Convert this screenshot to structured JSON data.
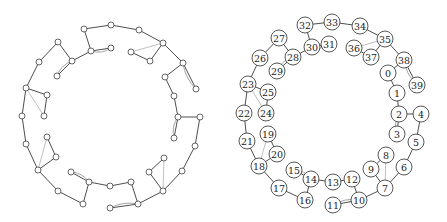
{
  "figure": {
    "panels": [
      {
        "id": "left",
        "description": "unlabeled graph drawing"
      },
      {
        "id": "right",
        "description": "labeled graph drawing"
      }
    ]
  },
  "nodes": [
    {
      "id": "0",
      "L": [
        165,
        77
      ],
      "R": [
        388,
        73
      ]
    },
    {
      "id": "1",
      "L": [
        174,
        96
      ],
      "R": [
        397,
        93
      ]
    },
    {
      "id": "2",
      "L": [
        178,
        117
      ],
      "R": [
        399,
        114
      ]
    },
    {
      "id": "3",
      "L": [
        174,
        138
      ],
      "R": [
        397,
        134
      ]
    },
    {
      "id": "4",
      "L": [
        200,
        117
      ],
      "R": [
        421,
        114
      ]
    },
    {
      "id": "5",
      "L": [
        195,
        146
      ],
      "R": [
        416,
        142
      ]
    },
    {
      "id": "6",
      "L": [
        182,
        171
      ],
      "R": [
        404,
        167
      ]
    },
    {
      "id": "7",
      "L": [
        163,
        191
      ],
      "R": [
        385,
        188
      ]
    },
    {
      "id": "8",
      "L": [
        164,
        158
      ],
      "R": [
        386,
        155
      ]
    },
    {
      "id": "9",
      "L": [
        149,
        172
      ],
      "R": [
        371,
        169
      ]
    },
    {
      "id": "10",
      "L": [
        138,
        204
      ],
      "R": [
        359,
        200
      ]
    },
    {
      "id": "11",
      "L": [
        110,
        208
      ],
      "R": [
        333,
        205
      ]
    },
    {
      "id": "12",
      "L": [
        131,
        182
      ],
      "R": [
        352,
        179
      ]
    },
    {
      "id": "13",
      "L": [
        110,
        186
      ],
      "R": [
        333,
        182
      ]
    },
    {
      "id": "14",
      "L": [
        89,
        182
      ],
      "R": [
        311,
        179
      ]
    },
    {
      "id": "15",
      "L": [
        71,
        172
      ],
      "R": [
        294,
        170
      ]
    },
    {
      "id": "16",
      "L": [
        83,
        204
      ],
      "R": [
        305,
        200
      ]
    },
    {
      "id": "17",
      "L": [
        58,
        191
      ],
      "R": [
        279,
        188
      ]
    },
    {
      "id": "18",
      "L": [
        38,
        170
      ],
      "R": [
        259,
        166
      ]
    },
    {
      "id": "19",
      "L": [
        47,
        137
      ],
      "R": [
        268,
        134
      ]
    },
    {
      "id": "20",
      "L": [
        56,
        157
      ],
      "R": [
        277,
        154
      ]
    },
    {
      "id": "21",
      "L": [
        26,
        144
      ],
      "R": [
        247,
        141
      ]
    },
    {
      "id": "22",
      "L": [
        22,
        116
      ],
      "R": [
        244,
        113
      ]
    },
    {
      "id": "23",
      "L": [
        26,
        88
      ],
      "R": [
        248,
        84
      ]
    },
    {
      "id": "24",
      "L": [
        44,
        116
      ],
      "R": [
        266,
        113
      ]
    },
    {
      "id": "25",
      "L": [
        47,
        95
      ],
      "R": [
        268,
        92
      ]
    },
    {
      "id": "26",
      "L": [
        39,
        62
      ],
      "R": [
        260,
        58
      ]
    },
    {
      "id": "27",
      "L": [
        58,
        42
      ],
      "R": [
        279,
        38
      ]
    },
    {
      "id": "28",
      "L": [
        72,
        61
      ],
      "R": [
        293,
        57
      ]
    },
    {
      "id": "29",
      "L": [
        57,
        76
      ],
      "R": [
        277,
        71
      ]
    },
    {
      "id": "30",
      "L": [
        91,
        51
      ],
      "R": [
        312,
        47
      ]
    },
    {
      "id": "31",
      "L": [
        111,
        48
      ],
      "R": [
        329,
        44
      ]
    },
    {
      "id": "32",
      "L": [
        84,
        29
      ],
      "R": [
        305,
        25
      ]
    },
    {
      "id": "33",
      "L": [
        111,
        25
      ],
      "R": [
        332,
        22
      ]
    },
    {
      "id": "34",
      "L": [
        139,
        30
      ],
      "R": [
        360,
        26
      ]
    },
    {
      "id": "35",
      "L": [
        163,
        43
      ],
      "R": [
        385,
        39
      ]
    },
    {
      "id": "36",
      "L": [
        131,
        52
      ],
      "R": [
        354,
        48
      ]
    },
    {
      "id": "37",
      "L": [
        150,
        61
      ],
      "R": [
        371,
        57
      ]
    },
    {
      "id": "38",
      "L": [
        183,
        63
      ],
      "R": [
        404,
        60
      ]
    },
    {
      "id": "39",
      "L": [
        196,
        89
      ],
      "R": [
        417,
        85
      ]
    }
  ],
  "edges": [
    [
      "0",
      "1",
      "dark"
    ],
    [
      "1",
      "2",
      "dark"
    ],
    [
      "2",
      "4",
      "dark"
    ],
    [
      "2",
      "3",
      "dark"
    ],
    [
      "2",
      "3",
      "curve"
    ],
    [
      "4",
      "5",
      "dark"
    ],
    [
      "5",
      "6",
      "dark"
    ],
    [
      "6",
      "7",
      "dark"
    ],
    [
      "7",
      "9",
      "dark"
    ],
    [
      "9",
      "8",
      "dark"
    ],
    [
      "8",
      "7",
      "light"
    ],
    [
      "7",
      "10",
      "dark"
    ],
    [
      "10",
      "12",
      "dark"
    ],
    [
      "10",
      "11",
      "dark"
    ],
    [
      "10",
      "11",
      "curve"
    ],
    [
      "12",
      "13",
      "dark"
    ],
    [
      "13",
      "14",
      "dark"
    ],
    [
      "14",
      "15",
      "dark"
    ],
    [
      "14",
      "15",
      "curve"
    ],
    [
      "14",
      "16",
      "dark"
    ],
    [
      "16",
      "17",
      "dark"
    ],
    [
      "17",
      "18",
      "dark"
    ],
    [
      "18",
      "20",
      "dark"
    ],
    [
      "20",
      "19",
      "dark"
    ],
    [
      "19",
      "18",
      "light"
    ],
    [
      "18",
      "21",
      "dark"
    ],
    [
      "21",
      "22",
      "dark"
    ],
    [
      "22",
      "23",
      "dark"
    ],
    [
      "23",
      "25",
      "dark"
    ],
    [
      "25",
      "24",
      "dark"
    ],
    [
      "23",
      "24",
      "light"
    ],
    [
      "23",
      "26",
      "dark"
    ],
    [
      "26",
      "27",
      "dark"
    ],
    [
      "27",
      "28",
      "dark"
    ],
    [
      "28",
      "29",
      "dark"
    ],
    [
      "28",
      "29",
      "curve"
    ],
    [
      "28",
      "30",
      "dark"
    ],
    [
      "30",
      "31",
      "dark"
    ],
    [
      "30",
      "31",
      "curve"
    ],
    [
      "30",
      "32",
      "dark"
    ],
    [
      "32",
      "33",
      "dark"
    ],
    [
      "33",
      "34",
      "dark"
    ],
    [
      "34",
      "35",
      "dark"
    ],
    [
      "35",
      "36",
      "light"
    ],
    [
      "36",
      "37",
      "dark"
    ],
    [
      "37",
      "35",
      "dark"
    ],
    [
      "35",
      "38",
      "dark"
    ],
    [
      "38",
      "0",
      "dark"
    ],
    [
      "38",
      "39",
      "dark"
    ],
    [
      "38",
      "39",
      "curve"
    ]
  ]
}
